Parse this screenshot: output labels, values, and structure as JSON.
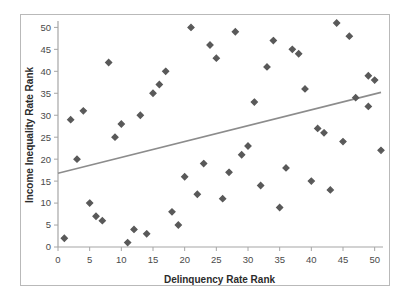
{
  "chart_data": {
    "type": "scatter",
    "title": "",
    "xlabel": "Delinquency Rate Rank",
    "ylabel": "Income Inequality Rate Rank",
    "xlim": [
      0,
      51
    ],
    "ylim": [
      0,
      51
    ],
    "xticks": [
      0,
      5,
      10,
      15,
      20,
      25,
      30,
      35,
      40,
      45,
      50
    ],
    "yticks": [
      0,
      5,
      10,
      15,
      20,
      25,
      30,
      35,
      40,
      45,
      50
    ],
    "grid": false,
    "legend": "none",
    "marker": "diamond",
    "marker_color": "#595959",
    "series": [
      {
        "name": "States",
        "points": [
          [
            1,
            2
          ],
          [
            2,
            29
          ],
          [
            3,
            20
          ],
          [
            4,
            31
          ],
          [
            5,
            10
          ],
          [
            6,
            7
          ],
          [
            7,
            6
          ],
          [
            8,
            42
          ],
          [
            9,
            25
          ],
          [
            10,
            28
          ],
          [
            11,
            1
          ],
          [
            12,
            4
          ],
          [
            13,
            30
          ],
          [
            14,
            3
          ],
          [
            15,
            35
          ],
          [
            16,
            37
          ],
          [
            17,
            40
          ],
          [
            18,
            8
          ],
          [
            19,
            5
          ],
          [
            20,
            16
          ],
          [
            21,
            50
          ],
          [
            22,
            12
          ],
          [
            23,
            19
          ],
          [
            24,
            46
          ],
          [
            25,
            43
          ],
          [
            26,
            11
          ],
          [
            27,
            17
          ],
          [
            28,
            49
          ],
          [
            29,
            21
          ],
          [
            30,
            23
          ],
          [
            31,
            33
          ],
          [
            32,
            14
          ],
          [
            33,
            41
          ],
          [
            34,
            47
          ],
          [
            35,
            9
          ],
          [
            36,
            18
          ],
          [
            37,
            45
          ],
          [
            38,
            44
          ],
          [
            39,
            36
          ],
          [
            40,
            15
          ],
          [
            41,
            27
          ],
          [
            42,
            26
          ],
          [
            43,
            13
          ],
          [
            44,
            51
          ],
          [
            45,
            24
          ],
          [
            46,
            48
          ],
          [
            47,
            34
          ],
          [
            49,
            39
          ],
          [
            49,
            32
          ],
          [
            50,
            38
          ],
          [
            51,
            22
          ]
        ]
      }
    ],
    "trendline": {
      "color": "#8c8c8c",
      "x_start": 0,
      "y_start": 16.8,
      "x_end": 51,
      "y_end": 35.2
    }
  }
}
